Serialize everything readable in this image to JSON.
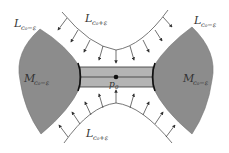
{
  "diagram": {
    "colors": {
      "region_fill": "#8c8c8c",
      "bar_fill": "#b4b4b4",
      "stroke": "#222222",
      "arc": "#555555",
      "background": "#ffffff"
    },
    "labels": {
      "top_left": {
        "main": "L",
        "sub": "c₀−ε"
      },
      "top_right": {
        "main": "L",
        "sub": "c₀−ε"
      },
      "top_center": {
        "main": "L",
        "sub": "c₀+ε"
      },
      "bottom_center": {
        "main": "L",
        "sub": "c₀+ε"
      },
      "left_region": {
        "main": "M",
        "sub": "c₀−ε"
      },
      "right_region": {
        "main": "M",
        "sub": "c₀−ε"
      },
      "center_point": {
        "main": "p",
        "sub": "0"
      }
    },
    "elements": {
      "left_region": "shaded sublevel region M_{c0-ε} (left)",
      "right_region": "shaded sublevel region M_{c0-ε} (right)",
      "handle": "horizontal handle/bar connecting both regions through p0",
      "top_arc": "level set L_{c0+ε} (upper) with inward arrows",
      "bottom_arc": "level set L_{c0+ε} (lower) with inward arrows"
    }
  }
}
